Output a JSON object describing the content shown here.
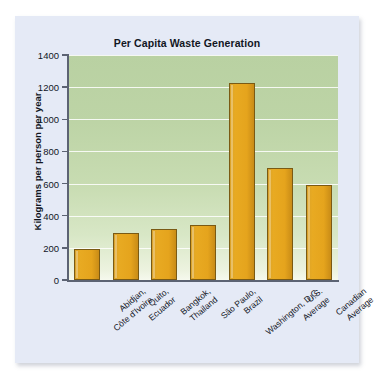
{
  "chart_data": {
    "type": "bar",
    "title": "Per Capita Waste Generation",
    "xlabel": "",
    "ylabel": "Kilograms per person per year",
    "ylim": [
      0,
      1400
    ],
    "yticks": [
      0,
      200,
      400,
      600,
      800,
      1000,
      1200,
      1400
    ],
    "ytick_labels": [
      "0",
      "200",
      "400",
      "600",
      "800",
      "1000",
      "1200",
      "1400"
    ],
    "grid": true,
    "legend": false,
    "bar_color": "#E5A41D",
    "bar_edge_color": "#7A5A14",
    "plot_background": "green-gradient",
    "categories": [
      "Abidjan, Côte d'Ivoire",
      "Quito, Ecuador",
      "Bangkok, Thailand",
      "São Paulo, Brazil",
      "Washington, D.C.",
      "U.S. Average",
      "Canadian Average"
    ],
    "category_lines": [
      [
        "Abidjan,",
        "Côte d'Ivoire"
      ],
      [
        "Quito,",
        "Ecuador"
      ],
      [
        "Bangkok,",
        "Thailand"
      ],
      [
        "São Paulo,",
        "Brazil"
      ],
      [
        "Washington, D.C."
      ],
      [
        "U.S.",
        "Average"
      ],
      [
        "Canadian",
        "Average"
      ]
    ],
    "values": [
      190,
      295,
      320,
      340,
      1225,
      700,
      590
    ]
  }
}
